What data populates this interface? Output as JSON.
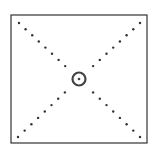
{
  "diagram": {
    "frame": {
      "x": 11,
      "y": 15,
      "width": 136,
      "height": 128,
      "stroke": "#333333"
    },
    "center": {
      "x": 79,
      "y": 79
    },
    "target_ring": {
      "r": 6.5,
      "stroke": "#444444",
      "dot_r": 1.3
    },
    "guide_dots": {
      "color": "#333333",
      "r": 1.2,
      "count_per_arm": 8
    },
    "arm_ends": {
      "top_left": [
        19,
        23
      ],
      "top_right": [
        140,
        23
      ],
      "bottom_left": [
        18,
        137
      ],
      "bottom_right": [
        140,
        137
      ]
    },
    "corner_ticks": [
      "top-left",
      "top-right",
      "bottom-left",
      "bottom-right"
    ]
  }
}
